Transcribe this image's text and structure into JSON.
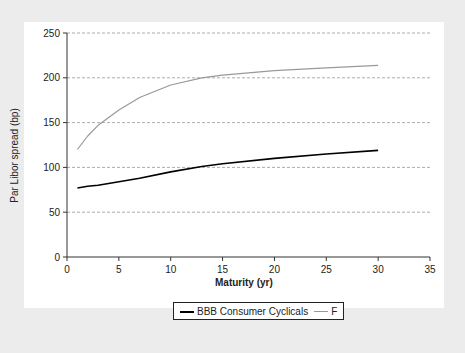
{
  "chart_data": {
    "type": "line",
    "title": "",
    "xlabel": "Maturity (yr)",
    "ylabel": "Par Libor spread (bp)",
    "xlim": [
      0,
      35
    ],
    "ylim": [
      0,
      250
    ],
    "xticks": [
      0,
      5,
      10,
      15,
      20,
      25,
      30,
      35
    ],
    "yticks": [
      0,
      50,
      100,
      150,
      200,
      250
    ],
    "grid": "horizontal dashed",
    "legend_position": "bottom",
    "series": [
      {
        "name": "BBB Consumer Cyclicals",
        "color": "#000000",
        "x": [
          1,
          2,
          3,
          5,
          7,
          10,
          13,
          15,
          20,
          25,
          30
        ],
        "y": [
          77,
          79,
          80,
          84,
          88,
          95,
          101,
          104,
          110,
          115,
          119
        ]
      },
      {
        "name": "F",
        "color": "#999999",
        "x": [
          1,
          2,
          3,
          5,
          7,
          10,
          13,
          15,
          20,
          25,
          30
        ],
        "y": [
          120,
          135,
          147,
          164,
          178,
          192,
          200,
          203,
          208,
          211,
          214
        ]
      }
    ]
  },
  "legend": {
    "items": [
      {
        "label": "BBB Consumer Cyclicals"
      },
      {
        "label": "F"
      }
    ]
  }
}
